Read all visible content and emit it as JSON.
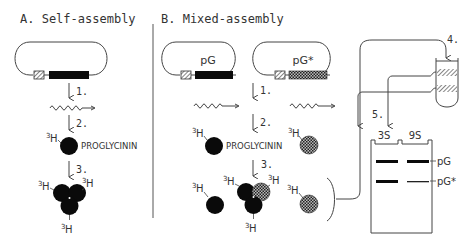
{
  "panel_a": {
    "title": "A. Self-assembly",
    "steps": [
      "1.",
      "2.",
      "3."
    ],
    "protein_label": "PROGLYCININ",
    "isotope_label": "3H",
    "isotope_sup": "3",
    "isotope_base": "H"
  },
  "panel_b": {
    "title": "B. Mixed-assembly",
    "plasmids": [
      {
        "label": "pG",
        "insert_fill": "solid"
      },
      {
        "label": "pG*",
        "insert_fill": "hatched"
      }
    ],
    "steps": [
      "1.",
      "2.",
      "3.",
      "4.",
      "5."
    ],
    "protein_label": "PROGLYCININ",
    "isotope_sup": "3",
    "isotope_base": "H",
    "gradient_fractions": [
      "3S",
      "9S"
    ],
    "gel_bands": [
      {
        "label": "pG",
        "lane_3S": "strong",
        "lane_9S": "strong"
      },
      {
        "label": "pG*",
        "lane_3S": "strong",
        "lane_9S": "weak"
      }
    ]
  },
  "colors": {
    "line": "#444444",
    "solid": "#0a0a0a",
    "hatched": "#5a5a5a",
    "text": "#333333"
  }
}
